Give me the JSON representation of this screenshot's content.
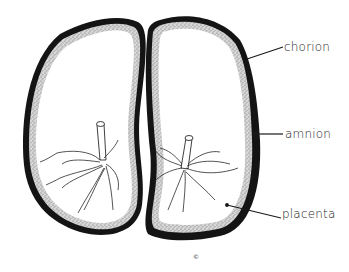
{
  "diagram": {
    "labels": {
      "chorion": "chorion",
      "amnion": "amnion",
      "placenta": "placenta"
    },
    "copyright_mark": "©",
    "colors": {
      "chorion_outline": "#141414",
      "amnion_stipple": "#b8b8b8",
      "interior": "#ffffff",
      "vessel_lines": "#2a2a2a"
    }
  }
}
